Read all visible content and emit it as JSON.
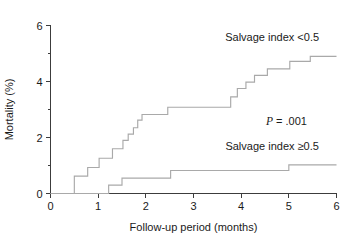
{
  "chart_data": {
    "type": "line",
    "title": "",
    "xlabel": "Follow-up period (months)",
    "ylabel": "Mortality (%)",
    "xlim": [
      0,
      6
    ],
    "ylim": [
      0,
      6
    ],
    "xticks": [
      "0",
      "1",
      "2",
      "3",
      "4",
      "5",
      "6"
    ],
    "xtick_values": [
      0,
      1,
      2,
      3,
      4,
      5,
      6
    ],
    "yticks": [
      "0",
      "2",
      "4",
      "6"
    ],
    "ytick_values": [
      0,
      2,
      4,
      6
    ],
    "grid": false,
    "legend": "inline-annotations",
    "line_color": "#a9a9a9",
    "axis_color": "#3c3c3c",
    "annotations": [
      {
        "name": "p-value",
        "italic_part": "P",
        "rest": " = .001",
        "text": "P = .001",
        "x": 4.95,
        "y": 2.45
      },
      {
        "name": "upper-series-label",
        "text": "Salvage index <0.5",
        "x": 4.65,
        "y": 5.45
      },
      {
        "name": "lower-series-label",
        "text": "Salvage index ≥0.5",
        "x": 4.65,
        "y": 1.55
      }
    ],
    "series": [
      {
        "name": "Salvage index <0.5",
        "step": "post",
        "points": [
          [
            0.0,
            0.0
          ],
          [
            0.5,
            0.0
          ],
          [
            0.5,
            0.62
          ],
          [
            0.78,
            0.62
          ],
          [
            0.78,
            0.93
          ],
          [
            1.02,
            0.93
          ],
          [
            1.02,
            1.26
          ],
          [
            1.3,
            1.26
          ],
          [
            1.3,
            1.6
          ],
          [
            1.52,
            1.6
          ],
          [
            1.52,
            1.9
          ],
          [
            1.63,
            1.9
          ],
          [
            1.63,
            2.12
          ],
          [
            1.74,
            2.12
          ],
          [
            1.74,
            2.35
          ],
          [
            1.83,
            2.35
          ],
          [
            1.83,
            2.62
          ],
          [
            1.92,
            2.62
          ],
          [
            1.92,
            2.82
          ],
          [
            2.46,
            2.82
          ],
          [
            2.46,
            3.08
          ],
          [
            3.78,
            3.08
          ],
          [
            3.78,
            3.45
          ],
          [
            3.92,
            3.45
          ],
          [
            3.92,
            3.75
          ],
          [
            4.1,
            3.75
          ],
          [
            4.1,
            3.98
          ],
          [
            4.28,
            3.98
          ],
          [
            4.28,
            4.22
          ],
          [
            4.55,
            4.22
          ],
          [
            4.55,
            4.45
          ],
          [
            5.02,
            4.45
          ],
          [
            5.02,
            4.72
          ],
          [
            5.45,
            4.72
          ],
          [
            5.45,
            4.9
          ],
          [
            6.0,
            4.9
          ]
        ]
      },
      {
        "name": "Salvage index ≥0.5",
        "step": "post",
        "points": [
          [
            0.0,
            0.0
          ],
          [
            1.22,
            0.0
          ],
          [
            1.22,
            0.3
          ],
          [
            1.5,
            0.3
          ],
          [
            1.5,
            0.55
          ],
          [
            2.52,
            0.55
          ],
          [
            2.52,
            0.82
          ],
          [
            5.0,
            0.82
          ],
          [
            5.0,
            1.02
          ],
          [
            6.0,
            1.02
          ]
        ]
      }
    ]
  },
  "axes": {
    "x_title": "Follow-up period (months)",
    "y_title": "Mortality (%)"
  }
}
